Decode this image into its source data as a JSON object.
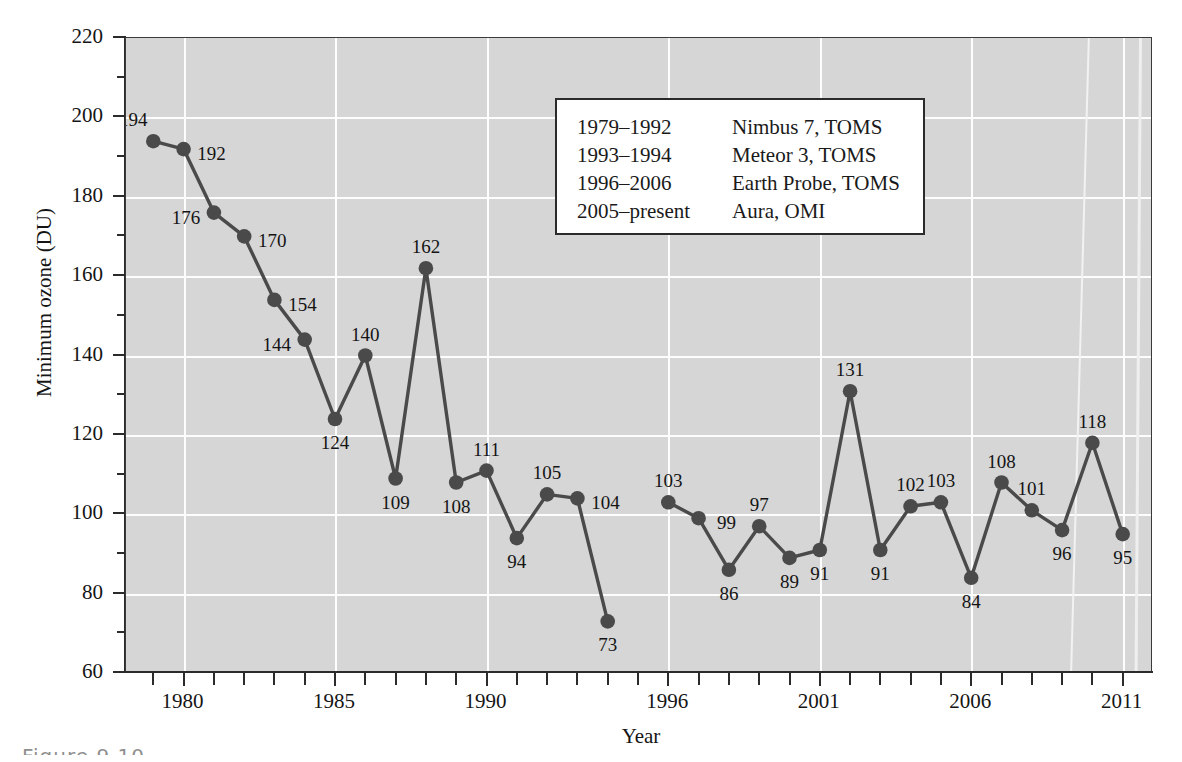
{
  "figure": {
    "caption_fragment": "Figure  9.10",
    "background_color": "#d6d6d6",
    "gridline_color": "#fdfdfd",
    "series_color": "#4a4a4a"
  },
  "axes": {
    "y_title": "Minimum ozone (DU)",
    "x_title": "Year",
    "y_major_labels": [
      "220",
      "200",
      "180",
      "160",
      "140",
      "120",
      "100",
      "80",
      "60"
    ],
    "y_major_values": [
      220,
      200,
      180,
      160,
      140,
      120,
      100,
      80,
      60
    ],
    "y_minor_values": [
      210,
      190,
      170,
      150,
      130,
      110,
      90,
      70
    ],
    "x_labels": [
      "1980",
      "1985",
      "1990",
      "1996",
      "2001",
      "2006",
      "2011"
    ],
    "x_label_values": [
      1980,
      1985,
      1990,
      1996,
      2001,
      2006,
      2011
    ]
  },
  "legend": {
    "rows": [
      {
        "years": "1979–1992",
        "instrument": "Nimbus 7, TOMS"
      },
      {
        "years": "1993–1994",
        "instrument": "Meteor 3, TOMS"
      },
      {
        "years": "1996–2006",
        "instrument": "Earth Probe, TOMS"
      },
      {
        "years": "2005–present",
        "instrument": "Aura, OMI"
      }
    ]
  },
  "chart_data": {
    "type": "line",
    "title": "",
    "xlabel": "Year",
    "ylabel": "Minimum ozone (DU)",
    "xlim": [
      1978,
      2012
    ],
    "ylim": [
      60,
      220
    ],
    "grid": true,
    "legend_position": "upper-center",
    "marker": "filled-circle",
    "x": [
      1979,
      1980,
      1981,
      1982,
      1983,
      1984,
      1985,
      1986,
      1987,
      1988,
      1989,
      1990,
      1991,
      1992,
      1993,
      1994,
      1996,
      1997,
      1998,
      1999,
      2000,
      2001,
      2002,
      2003,
      2004,
      2005,
      2006,
      2007,
      2008,
      2009,
      2010,
      2011
    ],
    "values": [
      194,
      192,
      176,
      170,
      154,
      144,
      124,
      140,
      109,
      162,
      108,
      111,
      94,
      105,
      104,
      73,
      103,
      99,
      86,
      97,
      89,
      91,
      131,
      91,
      102,
      103,
      84,
      108,
      101,
      96,
      118,
      95
    ],
    "point_labels": [
      "194",
      "192",
      "176",
      "170",
      "154",
      "144",
      "124",
      "140",
      "109",
      "162",
      "108",
      "111",
      "94",
      "105",
      "104",
      "73",
      "103",
      "99",
      "86",
      "97",
      "89",
      "91",
      "131",
      "91",
      "102",
      "103",
      "84",
      "108",
      "101",
      "96",
      "118",
      "95"
    ],
    "label_positions": [
      "above-left",
      "right",
      "left",
      "right",
      "right",
      "left",
      "below",
      "above",
      "below",
      "above",
      "below",
      "above",
      "below",
      "above",
      "right",
      "below",
      "above",
      "right",
      "below",
      "above",
      "below",
      "below",
      "above",
      "below",
      "above",
      "above",
      "below",
      "above",
      "above",
      "below",
      "above",
      "below"
    ],
    "missing_years": [
      1995
    ]
  }
}
